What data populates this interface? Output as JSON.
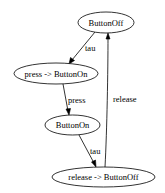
{
  "diagram": {
    "type": "state-graph",
    "nodes": [
      {
        "id": "n1",
        "label": "ButtonOff"
      },
      {
        "id": "n2",
        "label": "press -> ButtonOn"
      },
      {
        "id": "n3",
        "label": "ButtonOn"
      },
      {
        "id": "n4",
        "label": "release -> ButtonOff"
      }
    ],
    "edges": [
      {
        "from": "n1",
        "to": "n2",
        "label": "tau"
      },
      {
        "from": "n2",
        "to": "n3",
        "label": "press"
      },
      {
        "from": "n3",
        "to": "n4",
        "label": "tau"
      },
      {
        "from": "n4",
        "to": "n1",
        "label": "release"
      }
    ]
  }
}
